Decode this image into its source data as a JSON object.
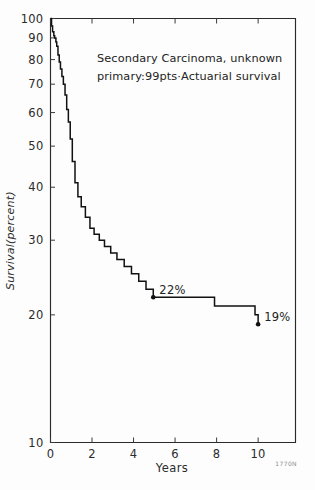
{
  "figure": {
    "title_line1": "Secondary Carcinoma, unknown",
    "title_line2": "primary:99pts·Actuarial survival",
    "watermark": "1770N"
  },
  "chart_data": {
    "type": "line",
    "title": "Secondary Carcinoma, unknown primary:99pts·Actuarial survival",
    "xlabel": "Years",
    "ylabel": "Survival(percent)",
    "xlim": [
      0,
      11.8
    ],
    "ylim": [
      10,
      100
    ],
    "yscale": "log",
    "grid": false,
    "legend": null,
    "xticks": [
      0,
      2,
      4,
      6,
      8,
      10
    ],
    "xticklabels": [
      "0",
      "2",
      "4",
      "6",
      "8",
      "10"
    ],
    "yticks": [
      10,
      20,
      30,
      40,
      50,
      60,
      70,
      80,
      90,
      100
    ],
    "yticklabels": [
      "10",
      "20",
      "30",
      "40",
      "50",
      "60",
      "70",
      "80",
      "90",
      "100"
    ],
    "series": [
      {
        "name": "Actuarial survival",
        "style": "step-post",
        "x": [
          0.0,
          0.05,
          0.1,
          0.16,
          0.2,
          0.26,
          0.3,
          0.36,
          0.42,
          0.48,
          0.55,
          0.62,
          0.7,
          0.78,
          0.86,
          0.95,
          1.05,
          1.18,
          1.32,
          1.48,
          1.68,
          1.9,
          2.1,
          2.35,
          2.6,
          2.9,
          3.2,
          3.55,
          3.9,
          4.25,
          4.6,
          4.95,
          7.9,
          9.85,
          10.0
        ],
        "y": [
          100,
          96,
          93,
          91,
          90,
          88,
          86,
          82,
          79,
          76,
          73,
          70,
          66,
          61,
          57,
          52,
          46,
          41,
          38,
          36,
          34,
          32,
          31,
          30,
          29,
          28,
          27,
          26,
          25,
          24,
          23,
          22,
          21,
          20,
          19
        ]
      }
    ],
    "annotations": [
      {
        "label": "22%",
        "x": 4.95,
        "y": 22,
        "marker": "dot"
      },
      {
        "label": "19%",
        "x": 10.0,
        "y": 19,
        "marker": "dot"
      }
    ]
  }
}
